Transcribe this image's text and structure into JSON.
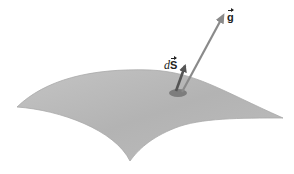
{
  "diagram": {
    "labels": {
      "area_element_d": "d",
      "area_element_s": "S",
      "field": "g"
    },
    "colors": {
      "surface": "#b9b9b9",
      "surface_edge": "#a8a8a8",
      "patch": "#7a7a7a",
      "ds_arrow": "#555555",
      "g_arrow": "#8a8a8a"
    }
  }
}
